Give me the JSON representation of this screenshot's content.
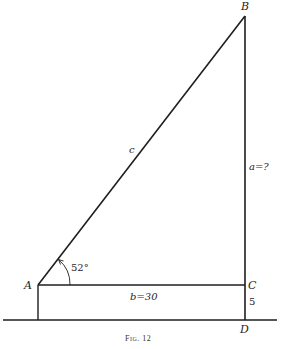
{
  "figure": {
    "caption": "Fig. 12",
    "vertices": {
      "A": "A",
      "B": "B",
      "C": "C",
      "D": "D"
    },
    "sides": {
      "hypotenuse": "c",
      "opposite": "a=?",
      "adjacent": "b=30",
      "height_offset": "5"
    },
    "angle": {
      "at": "A",
      "value": "52°"
    },
    "colors": {
      "line": "#1e1e1e",
      "background": "#ffffff"
    }
  }
}
